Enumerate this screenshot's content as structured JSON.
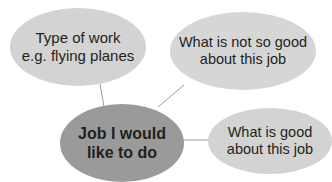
{
  "diagram": {
    "type": "mind-map",
    "center": {
      "line1": "Job I would",
      "line2": "like to do",
      "color": "#9a9a9a"
    },
    "branches": [
      {
        "line1": "Type of work",
        "line2": "e.g. flying planes",
        "color": "#d3d3d3"
      },
      {
        "line1": "What is not so good",
        "line2": "about this job",
        "color": "#d6d6d6"
      },
      {
        "line1": "What is good",
        "line2": "about this job",
        "color": "#d3d3d3"
      }
    ],
    "connector_color": "#9c9c9c"
  }
}
